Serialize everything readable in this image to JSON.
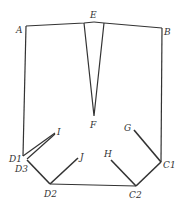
{
  "diagram": {
    "type": "pattern-draft",
    "stroke_color": "#333333",
    "background": "#ffffff",
    "labels": {
      "A": "A",
      "B": "B",
      "E": "E",
      "F": "F",
      "G": "G",
      "H": "H",
      "I": "I",
      "J": "J",
      "C1": "C1",
      "C2": "C2",
      "D1": "D1",
      "D2": "D2",
      "D3": "D3"
    },
    "points": {
      "A": [
        26,
        26
      ],
      "E": [
        94,
        22
      ],
      "B": [
        162,
        28
      ],
      "F": [
        94,
        116
      ],
      "D1": [
        23,
        156
      ],
      "D3": [
        27,
        160
      ],
      "I": [
        55,
        133
      ],
      "D2": [
        50,
        184
      ],
      "J": [
        79,
        157
      ],
      "C2": [
        136,
        186
      ],
      "H": [
        110,
        160
      ],
      "C1": [
        161,
        162
      ],
      "G": [
        133,
        129
      ]
    }
  }
}
